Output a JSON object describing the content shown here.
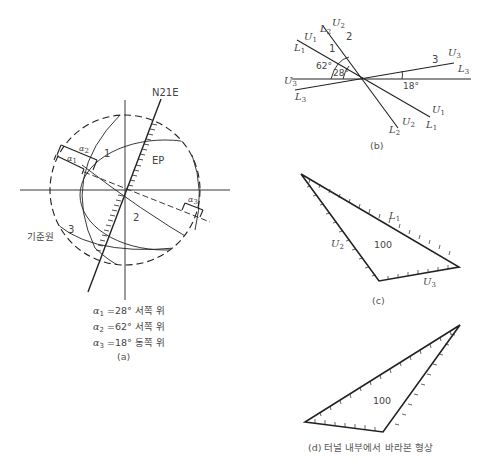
{
  "figure_a": {
    "strike_label": "N21E",
    "ep_label": "EP",
    "region_labels": [
      "1",
      "2",
      "3"
    ],
    "reference_circle_label": "기준원",
    "angle_labels": [
      "α1",
      "α2",
      "α3"
    ],
    "equations": [
      {
        "symbol": "α",
        "sub": "1",
        "text": "=28° 서쪽 위"
      },
      {
        "symbol": "α",
        "sub": "2",
        "text": "=62° 서쪽 위"
      },
      {
        "symbol": "α",
        "sub": "3",
        "text": "=18° 동쪽 위"
      }
    ],
    "caption": "(a)"
  },
  "figure_b": {
    "line_labels": {
      "U1_top": {
        "sym": "U",
        "sub": "1"
      },
      "L1_top": {
        "sym": "L",
        "sub": "1"
      },
      "U2_top": {
        "sym": "U",
        "sub": "2"
      },
      "L2_top": {
        "sym": "L",
        "sub": "2"
      },
      "U3_right": {
        "sym": "U",
        "sub": "3"
      },
      "L3_right": {
        "sym": "L",
        "sub": "3"
      },
      "U3_left": {
        "sym": "U",
        "sub": "3"
      },
      "L3_left": {
        "sym": "L",
        "sub": "3"
      },
      "U1_bottom": {
        "sym": "U",
        "sub": "1"
      },
      "L1_bottom": {
        "sym": "L",
        "sub": "1"
      },
      "U2_bottom": {
        "sym": "U",
        "sub": "2"
      },
      "L2_bottom": {
        "sym": "L",
        "sub": "2"
      }
    },
    "region_labels": [
      "1",
      "2",
      "3"
    ],
    "angles": [
      "62°",
      "28°",
      "18°"
    ],
    "caption": "(b)"
  },
  "figure_c": {
    "edge_labels": [
      {
        "sym": "L",
        "sub": "1"
      },
      {
        "sym": "U",
        "sub": "2"
      },
      {
        "sym": "U",
        "sub": "3"
      }
    ],
    "value": "100",
    "caption": "(c)"
  },
  "figure_d": {
    "value": "100",
    "caption": "(d) 터널 내부에서 바라본 형상"
  }
}
